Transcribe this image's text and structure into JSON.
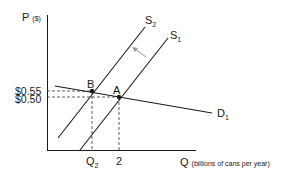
{
  "diagram": {
    "type": "supply-demand",
    "y_axis": {
      "label": "P",
      "unit": "($)"
    },
    "x_axis": {
      "label": "Q",
      "unit": "(billions of cans per year)"
    },
    "price_ticks": [
      {
        "label": "$0.55",
        "value": 0.55
      },
      {
        "label": "$0.50",
        "value": 0.5
      }
    ],
    "quantity_ticks": [
      {
        "label": "Q",
        "sub": "2"
      },
      {
        "label": "2",
        "value": 2
      }
    ],
    "curves": [
      {
        "name": "S",
        "sub": "2",
        "kind": "supply"
      },
      {
        "name": "S",
        "sub": "1",
        "kind": "supply"
      },
      {
        "name": "D",
        "sub": "1",
        "kind": "demand"
      }
    ],
    "points": [
      {
        "label": "B",
        "price": "$0.55",
        "quantity": "Q2"
      },
      {
        "label": "A",
        "price": "$0.50",
        "quantity": "2"
      }
    ],
    "shift_arrow": {
      "from": "S1",
      "to": "S2",
      "color": "#999999"
    },
    "colors": {
      "line": "#1a1a1a",
      "dashed": "#333333",
      "arrow": "#999999"
    }
  }
}
